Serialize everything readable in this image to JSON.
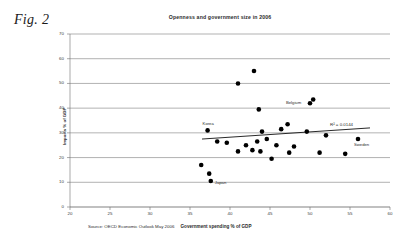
{
  "figure": {
    "caption": "Fig. 2"
  },
  "source": {
    "text": "Source: OECD Economic Outlook May 2006"
  },
  "chart_data": {
    "type": "scatter",
    "title": "Openness and government size in 2006",
    "xlabel": "Government spending % of GDP",
    "ylabel": "Imports % of GDP",
    "xlim": [
      20,
      60
    ],
    "ylim": [
      0,
      70
    ],
    "xticks": [
      20,
      25,
      30,
      35,
      40,
      45,
      50,
      55,
      60
    ],
    "xtick_labels": [
      "20",
      "25",
      "30",
      "35",
      "40",
      "45",
      "50",
      "55",
      "60"
    ],
    "yticks": [
      0,
      10,
      20,
      30,
      40,
      50,
      60,
      70
    ],
    "ytick_labels": [
      "0",
      "10",
      "20",
      "30",
      "40",
      "50",
      "60",
      "70"
    ],
    "grid": true,
    "grid_axis": "y",
    "legend": false,
    "marker_color": "#000000",
    "marker_size": 4.6,
    "points": [
      {
        "x": 37.2,
        "y": 31.0,
        "label": "Korea"
      },
      {
        "x": 41.0,
        "y": 50.0,
        "label": ""
      },
      {
        "x": 43.0,
        "y": 55.0,
        "label": ""
      },
      {
        "x": 43.6,
        "y": 39.5,
        "label": ""
      },
      {
        "x": 50.0,
        "y": 42.0,
        "label": "Belgium"
      },
      {
        "x": 50.4,
        "y": 43.5,
        "label": ""
      },
      {
        "x": 47.2,
        "y": 33.5,
        "label": ""
      },
      {
        "x": 44.0,
        "y": 30.5,
        "label": ""
      },
      {
        "x": 46.4,
        "y": 31.5,
        "label": ""
      },
      {
        "x": 49.6,
        "y": 30.5,
        "label": ""
      },
      {
        "x": 52.0,
        "y": 29.0,
        "label": ""
      },
      {
        "x": 56.0,
        "y": 27.5,
        "label": "Sweden"
      },
      {
        "x": 38.4,
        "y": 26.5,
        "label": ""
      },
      {
        "x": 39.6,
        "y": 26.0,
        "label": ""
      },
      {
        "x": 42.0,
        "y": 25.0,
        "label": ""
      },
      {
        "x": 43.4,
        "y": 26.5,
        "label": ""
      },
      {
        "x": 44.6,
        "y": 27.5,
        "label": ""
      },
      {
        "x": 45.8,
        "y": 25.0,
        "label": ""
      },
      {
        "x": 48.0,
        "y": 24.5,
        "label": ""
      },
      {
        "x": 41.0,
        "y": 22.5,
        "label": ""
      },
      {
        "x": 42.8,
        "y": 23.0,
        "label": ""
      },
      {
        "x": 43.8,
        "y": 22.5,
        "label": ""
      },
      {
        "x": 47.4,
        "y": 22.0,
        "label": ""
      },
      {
        "x": 51.2,
        "y": 22.0,
        "label": ""
      },
      {
        "x": 54.4,
        "y": 21.5,
        "label": ""
      },
      {
        "x": 45.2,
        "y": 19.5,
        "label": ""
      },
      {
        "x": 36.4,
        "y": 17.0,
        "label": ""
      },
      {
        "x": 37.4,
        "y": 13.5,
        "label": ""
      },
      {
        "x": 37.6,
        "y": 10.5,
        "label": "Japan"
      }
    ],
    "trendline": {
      "x_start": 36.5,
      "y_start": 27.5,
      "x_end": 57.5,
      "y_end": 32.0,
      "r_squared_label": "R² = 0.0144"
    }
  }
}
